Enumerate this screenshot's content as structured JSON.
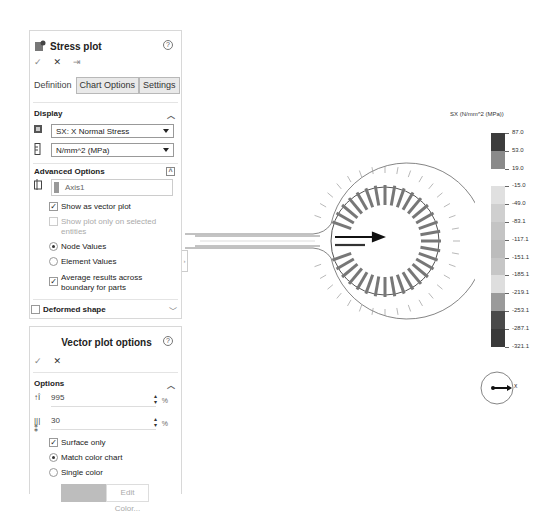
{
  "stress_panel": {
    "title": "Stress plot",
    "help_icon": "?",
    "actions": {
      "ok": "✓",
      "cancel": "✕",
      "pin": "⇥"
    },
    "tabs": [
      {
        "label": "Definition",
        "active": true
      },
      {
        "label": "Chart Options",
        "active": false
      },
      {
        "label": "Settings",
        "active": false
      }
    ],
    "display": {
      "heading": "Display",
      "component": "SX: X Normal Stress",
      "units": "N/mm^2 (MPa)"
    },
    "advanced": {
      "heading": "Advanced Options",
      "axis_value": "Axis1",
      "show_vector_plot": {
        "label": "Show as vector plot",
        "checked": true
      },
      "show_selected_only": {
        "label": "Show plot only on selected entities",
        "checked": false,
        "disabled": true
      },
      "node_values": {
        "label": "Node Values",
        "selected": true
      },
      "element_values": {
        "label": "Element Values",
        "selected": false
      },
      "average_results": {
        "label": "Average results across boundary for parts",
        "checked": true
      }
    },
    "deformed_shape": {
      "label": "Deformed shape",
      "checked": false
    }
  },
  "vector_panel": {
    "title": "Vector plot options",
    "help_icon": "?",
    "actions": {
      "ok": "✓",
      "cancel": "✕"
    },
    "options": {
      "heading": "Options",
      "size_value": "995",
      "size_unit": "%",
      "density_value": "30",
      "density_unit": "%",
      "surface_only": {
        "label": "Surface only",
        "checked": true
      },
      "match_color_chart": {
        "label": "Match color chart",
        "selected": true
      },
      "single_color": {
        "label": "Single color",
        "selected": false
      },
      "edit_color_label": "Edit Color..."
    }
  },
  "legend": {
    "title": "SX (N/mm^2 (MPa))",
    "labels": [
      "87.0",
      "53.0",
      "19.0",
      "-15.0",
      "-49.0",
      "-83.1",
      "-117.1",
      "-151.1",
      "-185.1",
      "-219.1",
      "-253.1",
      "-287.1",
      "-321.1"
    ],
    "colors": [
      "#3c3c3c",
      "#8a8a8a",
      "#ffffff",
      "#e0e0e0",
      "#cfcfcf",
      "#c4c4c4",
      "#bcbcbc",
      "#c6c6c6",
      "#dedede",
      "#9a9a9a",
      "#4a4a4a",
      "#3a3a3a"
    ]
  },
  "triad": {
    "axis_label": "X"
  }
}
